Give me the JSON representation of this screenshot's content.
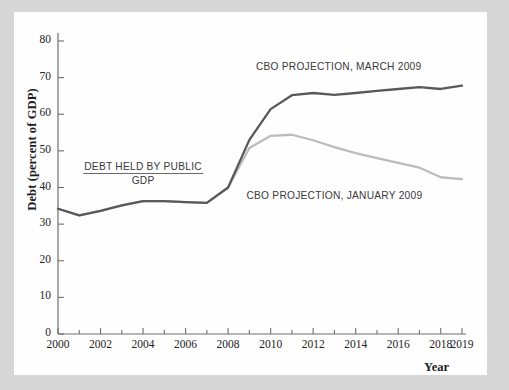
{
  "figure": {
    "background_color": "#d6d6d6",
    "card_color": "#fefefe"
  },
  "chart_data": {
    "type": "line",
    "title": "",
    "xlabel": "Year",
    "ylabel": "Debt (percent of GDP)",
    "xlim": [
      2000,
      2019
    ],
    "ylim": [
      0,
      80
    ],
    "grid": false,
    "legend_position": "inline-annotations",
    "x_ticks_major": [
      2000,
      2002,
      2004,
      2006,
      2008,
      2010,
      2012,
      2014,
      2016,
      2018,
      2019
    ],
    "x_ticks_minor": [
      2001,
      2003,
      2005,
      2007,
      2009,
      2011,
      2013,
      2015,
      2017
    ],
    "y_ticks": [
      0,
      10,
      20,
      30,
      40,
      50,
      60,
      70,
      80
    ],
    "x": [
      2000,
      2001,
      2002,
      2003,
      2004,
      2005,
      2006,
      2007,
      2008,
      2009,
      2010,
      2011,
      2012,
      2013,
      2014,
      2015,
      2016,
      2017,
      2018,
      2019
    ],
    "series": [
      {
        "name": "CBO PROJECTION, MARCH 2009",
        "color": "#595959",
        "values": [
          34.2,
          32.4,
          33.6,
          35.1,
          36.3,
          36.3,
          36.0,
          35.8,
          40.0,
          53.0,
          61.4,
          65.2,
          65.8,
          65.3,
          65.8,
          66.4,
          66.9,
          67.4,
          66.9,
          67.8
        ]
      },
      {
        "name": "CBO PROJECTION, JANUARY 2009",
        "color": "#bcbcbc",
        "values": [
          34.2,
          32.4,
          33.6,
          35.1,
          36.3,
          36.3,
          36.0,
          35.8,
          40.0,
          50.8,
          54.1,
          54.4,
          52.9,
          51.0,
          49.4,
          48.0,
          46.7,
          45.4,
          42.8,
          42.3
        ]
      }
    ],
    "annotations": [
      {
        "id": "march-label",
        "text": "CBO PROJECTION, MARCH 2009",
        "x": 2013.2,
        "y": 72.5
      },
      {
        "id": "january-label",
        "text": "CBO PROJECTION, JANUARY 2009",
        "x": 2013.0,
        "y": 37.5
      }
    ],
    "fraction_annotation": {
      "numerator": "DEBT HELD BY PUBLIC",
      "denominator": "GDP",
      "x": 2004.0,
      "y": 44.5
    }
  }
}
